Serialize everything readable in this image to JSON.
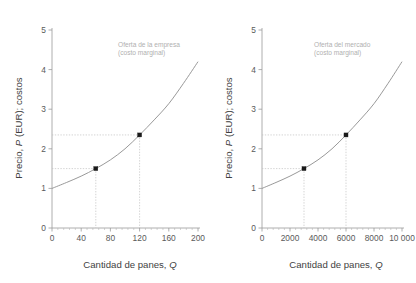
{
  "figure": {
    "background": "#ffffff",
    "curve_color": "#8d8d8d",
    "marker_color": "#1a1a1a",
    "guide_color": "#c2c2c2",
    "annotation_color": "#b0b0b0",
    "axis_color": "#9a9a9a"
  },
  "chart_data": [
    {
      "type": "line",
      "title": "",
      "subtitle": "",
      "panel": "left",
      "xlabel": "Cantidad de panes, Q",
      "ylabel": "Precio, P (EUR); costos",
      "xlim": [
        0,
        200
      ],
      "ylim": [
        0,
        5
      ],
      "xticks": [
        0,
        40,
        80,
        120,
        160,
        200
      ],
      "xticklabels": [
        "0",
        "40",
        "80",
        "120",
        "160",
        "200"
      ],
      "yticks": [
        0,
        1,
        2,
        3,
        4,
        5
      ],
      "yticklabels": [
        "0",
        "1",
        "2",
        "3",
        "4",
        "5"
      ],
      "x_minor_tick_count": 4,
      "grid": false,
      "legend": "none",
      "series": [
        {
          "name": "Oferta de la empresa (costo marginal)",
          "x": [
            0,
            20,
            40,
            60,
            80,
            100,
            120,
            140,
            160,
            180,
            200
          ],
          "values": [
            1.0,
            1.15,
            1.31,
            1.5,
            1.72,
            2.0,
            2.35,
            2.73,
            3.14,
            3.65,
            4.2
          ]
        }
      ],
      "annotations": [
        {
          "name": "supply-curve-label",
          "line1": "Oferta de la empresa",
          "line2": "(costo marginal)",
          "x": 118,
          "y": 42
        }
      ],
      "markers": [
        {
          "name": "point-low",
          "x": 60,
          "y": 1.5
        },
        {
          "name": "point-high",
          "x": 120,
          "y": 2.35
        }
      ],
      "guides": [
        {
          "name": "guide-low",
          "x": 60,
          "y": 1.5
        },
        {
          "name": "guide-high",
          "x": 120,
          "y": 2.35
        }
      ]
    },
    {
      "type": "line",
      "title": "",
      "subtitle": "",
      "panel": "right",
      "xlabel": "Cantidad de panes, Q",
      "ylabel": "Precio, P (EUR); costos",
      "xlim": [
        0,
        10000
      ],
      "ylim": [
        0,
        5
      ],
      "xticks": [
        0,
        2000,
        4000,
        6000,
        8000,
        10000
      ],
      "xticklabels": [
        "0",
        "2000",
        "4000",
        "6000",
        "8000",
        "10 000"
      ],
      "yticks": [
        0,
        1,
        2,
        3,
        4,
        5
      ],
      "yticklabels": [
        "0",
        "1",
        "2",
        "3",
        "4",
        "5"
      ],
      "x_minor_tick_count": 4,
      "grid": false,
      "legend": "none",
      "series": [
        {
          "name": "Oferta del mercado (costo marginal)",
          "x": [
            0,
            1000,
            2000,
            3000,
            4000,
            5000,
            6000,
            7000,
            8000,
            9000,
            10000
          ],
          "values": [
            1.0,
            1.15,
            1.31,
            1.5,
            1.72,
            2.0,
            2.35,
            2.73,
            3.14,
            3.65,
            4.2
          ]
        }
      ],
      "annotations": [
        {
          "name": "supply-curve-label",
          "line1": "Oferta del mercado",
          "line2": "(costo marginal)",
          "x": 106,
          "y": 42
        }
      ],
      "markers": [
        {
          "name": "point-low",
          "x": 3000,
          "y": 1.5
        },
        {
          "name": "point-high",
          "x": 6000,
          "y": 2.35
        }
      ],
      "guides": [
        {
          "name": "guide-low",
          "x": 3000,
          "y": 1.5
        },
        {
          "name": "guide-high",
          "x": 6000,
          "y": 2.35
        }
      ]
    }
  ],
  "ylabel_parts": {
    "prefix": "Precio, ",
    "italic": "P",
    "suffix": " (EUR); costos"
  },
  "xlabel_parts": {
    "prefix": "Cantidad de panes, ",
    "italic": "Q"
  }
}
